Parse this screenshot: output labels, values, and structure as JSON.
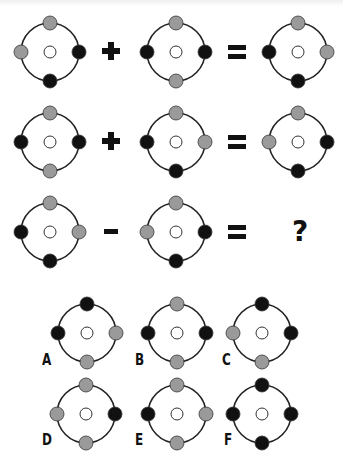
{
  "colors": {
    "black": "#111111",
    "gray": "#9a9a9a",
    "white": "#ffffff",
    "ring": "#222222"
  },
  "puzzle": {
    "rows": [
      {
        "operator": "+",
        "left": {
          "top": "gray",
          "left": "gray",
          "right": "black",
          "bottom": "black"
        },
        "right": {
          "top": "gray",
          "left": "black",
          "right": "black",
          "bottom": "gray"
        },
        "result": {
          "top": "gray",
          "left": "black",
          "right": "gray",
          "bottom": "black"
        }
      },
      {
        "operator": "+",
        "left": {
          "top": "gray",
          "left": "black",
          "right": "black",
          "bottom": "gray"
        },
        "right": {
          "top": "gray",
          "left": "black",
          "right": "gray",
          "bottom": "black"
        },
        "result": {
          "top": "gray",
          "left": "gray",
          "right": "black",
          "bottom": "black"
        }
      },
      {
        "operator": "−",
        "left": {
          "top": "gray",
          "left": "black",
          "right": "gray",
          "bottom": "black"
        },
        "right": {
          "top": "gray",
          "left": "gray",
          "right": "black",
          "bottom": "black"
        },
        "result": "?"
      }
    ],
    "equals": "=",
    "question_mark": "?"
  },
  "options": [
    {
      "label": "A",
      "nodes": {
        "top": "black",
        "left": "black",
        "right": "gray",
        "bottom": "gray"
      }
    },
    {
      "label": "B",
      "nodes": {
        "top": "gray",
        "left": "black",
        "right": "black",
        "bottom": "gray"
      }
    },
    {
      "label": "C",
      "nodes": {
        "top": "black",
        "left": "gray",
        "right": "black",
        "bottom": "gray"
      }
    },
    {
      "label": "D",
      "nodes": {
        "top": "gray",
        "left": "gray",
        "right": "black",
        "bottom": "gray"
      }
    },
    {
      "label": "E",
      "nodes": {
        "top": "gray",
        "left": "black",
        "right": "gray",
        "bottom": "gray"
      }
    },
    {
      "label": "F",
      "nodes": {
        "top": "black",
        "left": "black",
        "right": "black",
        "bottom": "black"
      }
    }
  ]
}
